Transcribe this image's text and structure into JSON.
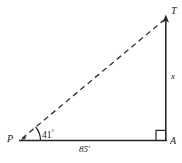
{
  "figure": {
    "type": "geometry-diagram",
    "shape": "right triangle",
    "stroke_color": "#262626",
    "background_color": "#ffffff",
    "vertices": {
      "p": {
        "label": "P",
        "x": 20,
        "y": 140,
        "role": "observation point, acute angle vertex"
      },
      "a": {
        "label": "A",
        "x": 166,
        "y": 140,
        "role": "right angle vertex, base of vertical"
      },
      "t": {
        "label": "T",
        "x": 166,
        "y": 18,
        "role": "top of vertical segment"
      }
    },
    "labels": {
      "vertex_p": "P",
      "vertex_a": "A",
      "vertex_t": "T",
      "angle_p": "41",
      "angle_p_degree_symbol": "°",
      "base": "85′",
      "height": "x"
    },
    "segments": [
      {
        "name": "base-PA",
        "from": "P",
        "to": "A",
        "style": "solid",
        "measure": "85′"
      },
      {
        "name": "vertical-AT",
        "from": "A",
        "to": "T",
        "style": "solid",
        "measure": "x"
      },
      {
        "name": "hypotenuse-PT",
        "from": "P",
        "to": "T",
        "style": "dashed",
        "measure": ""
      }
    ],
    "markers": {
      "right_angle": {
        "at": "A",
        "type": "square"
      },
      "angle_arc": {
        "at": "P",
        "type": "arc",
        "value": "41°"
      }
    }
  }
}
